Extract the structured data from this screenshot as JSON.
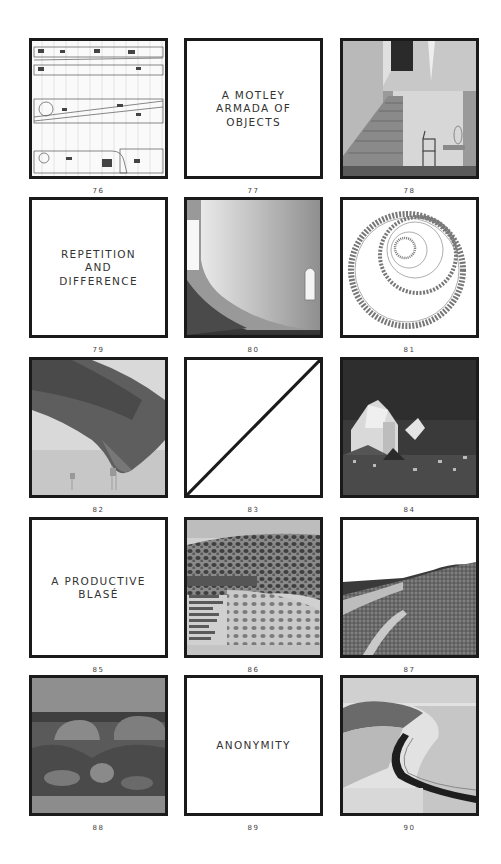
{
  "page": {
    "background": "#ffffff",
    "frame_border_color": "#1a1a1a"
  },
  "frames": [
    {
      "number": "76",
      "type": "image",
      "subject": "architectural-plan-drawing"
    },
    {
      "number": "77",
      "type": "text",
      "text": "A MOTLEY\nARMADA OF\nOBJECTS"
    },
    {
      "number": "78",
      "type": "image",
      "subject": "staircase-interior-with-chair"
    },
    {
      "number": "79",
      "type": "text",
      "text": "REPETITION\nAND\nDIFFERENCE"
    },
    {
      "number": "80",
      "type": "image",
      "subject": "curved-white-wall-interior"
    },
    {
      "number": "81",
      "type": "image",
      "subject": "spiral-drawing"
    },
    {
      "number": "82",
      "type": "image",
      "subject": "hand-collage-over-landscape"
    },
    {
      "number": "83",
      "type": "diagonal",
      "subject": "diagonal-line"
    },
    {
      "number": "84",
      "type": "image",
      "subject": "angular-church-above-village"
    },
    {
      "number": "85",
      "type": "text",
      "text": "A PRODUCTIVE\nBLASÉ"
    },
    {
      "number": "86",
      "type": "image",
      "subject": "stone-mosaic-collection"
    },
    {
      "number": "87",
      "type": "image",
      "subject": "gravel-hills-landscape"
    },
    {
      "number": "88",
      "type": "image",
      "subject": "rocky-landscape-with-domes"
    },
    {
      "number": "89",
      "type": "text",
      "text": "ANONYMITY"
    },
    {
      "number": "90",
      "type": "image",
      "subject": "coastal-curved-road-aerial"
    }
  ]
}
